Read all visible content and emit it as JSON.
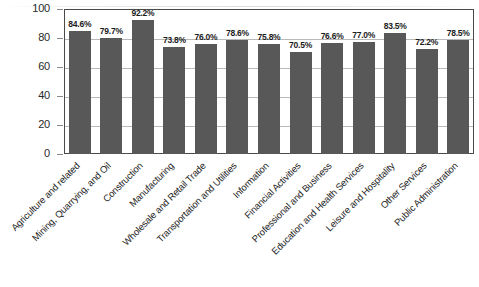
{
  "chart_data": {
    "type": "bar",
    "title": "",
    "subtitle": "",
    "xlabel": "",
    "ylabel": "",
    "ylim": [
      0,
      100
    ],
    "yticks": [
      0,
      20,
      40,
      60,
      80,
      100
    ],
    "ytick_labels": [
      "0",
      "20",
      "40",
      "60",
      "80",
      "100"
    ],
    "grid": true,
    "grid_axis": "y",
    "legend": false,
    "legend_position": "none",
    "bar_color": "#585858",
    "axis_color": "#4a4a4a",
    "gridline_color": "#b9b9b9",
    "label_rotation_deg": -45,
    "value_label_format": "percent-one-decimal",
    "categories": [
      "Agriculture and related",
      "Mining, Quarrying, and Oil",
      "Construction",
      "Manufacturing",
      "Wholesale and Retail Trade",
      "Transportation and Utilities",
      "Information",
      "Financial Activities",
      "Professional and Business",
      "Education and Health Services",
      "Leisure and Hospitality",
      "Other Services",
      "Public Administration"
    ],
    "values": [
      84.6,
      79.7,
      92.2,
      73.8,
      76.0,
      78.6,
      75.8,
      70.5,
      76.6,
      77.0,
      83.5,
      72.2,
      78.5
    ],
    "value_labels": [
      "84.6%",
      "79.7%",
      "92.2%",
      "73.8%",
      "76.0%",
      "78.6%",
      "75.8%",
      "70.5%",
      "76.6%",
      "77.0%",
      "83.5%",
      "72.2%",
      "78.5%"
    ]
  }
}
